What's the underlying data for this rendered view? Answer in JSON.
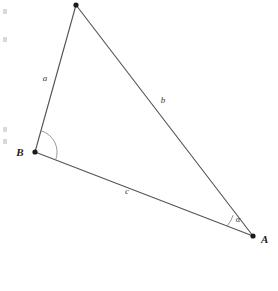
{
  "figure": {
    "background_color": "#ffffff",
    "width": 278,
    "height": 291,
    "line_color": "#555555",
    "arc_color": "#8d8d8d",
    "vertex_color": "#1b1b1b"
  },
  "vertices": {
    "top": {
      "label": "",
      "x": 76,
      "y": 5
    },
    "b": {
      "label": "B",
      "x": 35,
      "y": 152,
      "label_x": 20,
      "label_y": 156
    },
    "a": {
      "label": "A",
      "x": 253,
      "y": 236,
      "label_x": 261,
      "label_y": 243
    }
  },
  "sides": [
    {
      "name": "side-a",
      "label": "a",
      "x": 45,
      "y": 81,
      "from": "b",
      "to": "top"
    },
    {
      "name": "side-b",
      "label": "b",
      "x": 163,
      "y": 103,
      "from": "top",
      "to": "a"
    },
    {
      "name": "side-c",
      "label": "c",
      "x": 127,
      "y": 194,
      "from": "b",
      "to": "a"
    }
  ],
  "angles": [
    {
      "name": "angle-b",
      "label": "",
      "vertex": "B",
      "radius": 22
    },
    {
      "name": "angle-alpha",
      "label": "α",
      "vertex": "A",
      "radius": 26,
      "label_x": 238,
      "label_y": 222
    }
  ],
  "artifacts": [
    {
      "x": 3,
      "y": 9,
      "w": 4,
      "h": 5
    },
    {
      "x": 3,
      "y": 37,
      "w": 4,
      "h": 5
    },
    {
      "x": 3,
      "y": 127,
      "w": 4,
      "h": 5
    },
    {
      "x": 3,
      "y": 139,
      "w": 4,
      "h": 5
    }
  ]
}
